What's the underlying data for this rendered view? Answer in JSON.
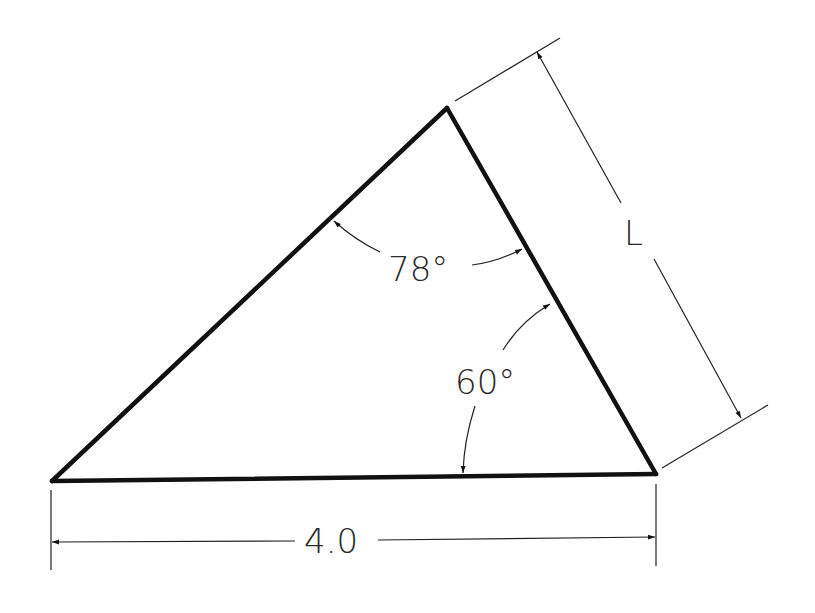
{
  "diagram": {
    "type": "triangle-dimension-drawing",
    "colors": {
      "background": "#ffffff",
      "line": "#111111",
      "dim_line": "#222222"
    },
    "vertices": {
      "A": [
        52,
        481
      ],
      "B": [
        447,
        108
      ],
      "C": [
        656,
        474
      ]
    },
    "angles": [
      {
        "label": "78°",
        "at_vertex": "B"
      },
      {
        "label": "60°",
        "at_vertex": "C"
      }
    ],
    "dimensions": [
      {
        "label": "4.0",
        "between": [
          "A",
          "C"
        ]
      },
      {
        "label": "L",
        "between": [
          "B",
          "C"
        ]
      }
    ]
  }
}
